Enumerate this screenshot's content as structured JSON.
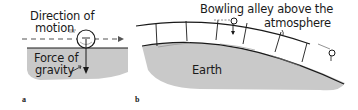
{
  "panels": [
    {
      "id": "a",
      "label": "a",
      "annotations": {
        "direction": [
          "Direction of",
          "motion"
        ],
        "gravity": [
          "Force of",
          "gravity"
        ]
      }
    },
    {
      "id": "b",
      "label": "b",
      "annotations": {
        "alley": [
          "Bowling alley above the",
          "atmosphere"
        ],
        "earth": "Earth"
      }
    }
  ],
  "colors": {
    "ground": "#c9c9c9",
    "ink": "#1a1a1a",
    "background": "#ffffff"
  }
}
